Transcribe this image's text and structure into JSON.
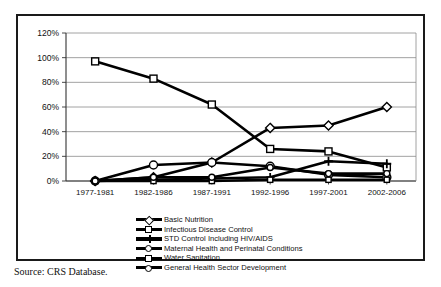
{
  "figure": {
    "source_note": "Source: CRS Database."
  },
  "chart_data": {
    "type": "line",
    "title": "",
    "xlabel": "",
    "ylabel": "",
    "categories": [
      "1977-1981",
      "1982-1986",
      "1987-1991",
      "1992-1996",
      "1997-2001",
      "2002-2006"
    ],
    "ylim": [
      0,
      120
    ],
    "yticks": [
      0,
      20,
      40,
      60,
      80,
      100,
      120
    ],
    "ytick_labels": [
      "0%",
      "20%",
      "40%",
      "60%",
      "80%",
      "100%",
      "120%"
    ],
    "grid": "horizontal",
    "legend_position": "below-axis",
    "series": [
      {
        "name": "Basic Nutrition",
        "marker": "diamond",
        "values": [
          0,
          3,
          15,
          43,
          45,
          60
        ]
      },
      {
        "name": "Infectious Disease Control",
        "marker": "square",
        "values": [
          97,
          83,
          62,
          26,
          24,
          11
        ]
      },
      {
        "name": "STD Control Including HIV/AIDS",
        "marker": "plus",
        "values": [
          0,
          1,
          2,
          3,
          16,
          14
        ]
      },
      {
        "name": "Maternal Health and Perinatal Conditions",
        "marker": "circle",
        "values": [
          0,
          13,
          15,
          12,
          5,
          3
        ]
      },
      {
        "name": "Water Sanitation",
        "marker": "square-small",
        "values": [
          0,
          0,
          0,
          1,
          1,
          1
        ]
      },
      {
        "name": "General Health Sector Development",
        "marker": "circle-small",
        "values": [
          0,
          3,
          3,
          11,
          6,
          6
        ]
      }
    ]
  }
}
